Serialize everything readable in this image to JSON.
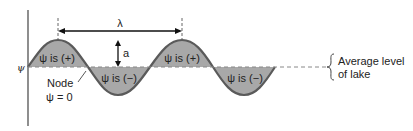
{
  "diagram": {
    "axis_label": "ψ",
    "wavelength_label": "λ",
    "amplitude_label": "a",
    "regions": [
      {
        "label": "ψ is (+)",
        "sign": "positive"
      },
      {
        "label": "ψ is (−)",
        "sign": "negative"
      },
      {
        "label": "ψ is (+)",
        "sign": "positive"
      },
      {
        "label": "ψ is (−)",
        "sign": "negative"
      }
    ],
    "node_label": "Node",
    "node_value": "ψ = 0",
    "baseline_label_line1": "Average level",
    "baseline_label_line2": "of lake",
    "colors": {
      "fill": "#a8a8a8",
      "stroke": "#5a5a5a",
      "text": "#222222"
    }
  }
}
